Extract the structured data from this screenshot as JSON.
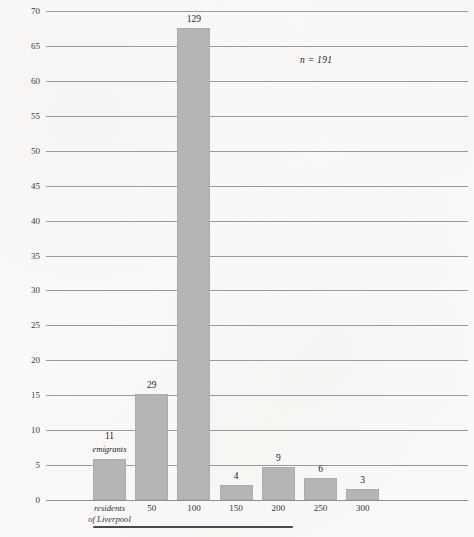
{
  "chart_data": {
    "type": "bar",
    "title": "",
    "xlabel": "",
    "ylabel": "Percent of emigrants leaving\nfrom Liverpool",
    "annotation": "n = 191",
    "ylim": [
      0,
      70
    ],
    "ytick_step": 5,
    "grid": true,
    "legend": "none",
    "categories": [
      "residents of Liverpool",
      "50",
      "100",
      "150",
      "200",
      "250",
      "300"
    ],
    "counts": [
      11,
      29,
      129,
      4,
      9,
      6,
      3
    ],
    "values": [
      5.8,
      15.2,
      67.5,
      2.1,
      4.7,
      3.1,
      1.6
    ],
    "bar_labels": [
      "11",
      "29",
      "129",
      "4",
      "9",
      "6",
      "3"
    ],
    "bar_sublabels": [
      "emigrants",
      "",
      "",
      "",
      "",
      "",
      ""
    ],
    "ytick_labels": [
      "0",
      "5",
      "10",
      "15",
      "20",
      "25",
      "30",
      "35",
      "40",
      "45",
      "50",
      "55",
      "60",
      "65",
      "70"
    ],
    "xtick_labels": [
      {
        "line1": "residents",
        "line2": "of Liverpool"
      },
      {
        "line1": "50",
        "line2": ""
      },
      {
        "line1": "100",
        "line2": ""
      },
      {
        "line1": "150",
        "line2": ""
      },
      {
        "line1": "200",
        "line2": ""
      },
      {
        "line1": "250",
        "line2": ""
      },
      {
        "line1": "300",
        "line2": ""
      }
    ],
    "colors": {
      "bar": "#b5b5b5",
      "gridline": "#8a8a8a",
      "background": "#fbfaf8",
      "text": "#2b2b2b",
      "bracket": "#4a4a4a"
    }
  }
}
